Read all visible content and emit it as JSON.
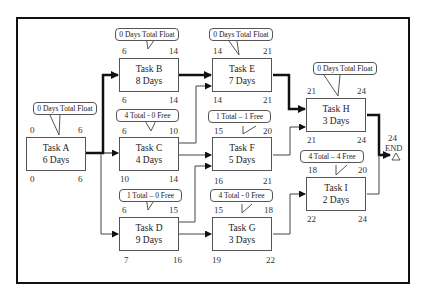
{
  "diagram": {
    "type": "activity-on-node network (critical path)",
    "tasks": [
      {
        "id": "A",
        "name": "Task A",
        "duration": "6 Days",
        "es": "0",
        "ef": "6",
        "ls": "0",
        "lf": "6",
        "float_label": "0 Days Total Float",
        "critical": true
      },
      {
        "id": "B",
        "name": "Task B",
        "duration": "8 Days",
        "es": "6",
        "ef": "14",
        "ls": "6",
        "lf": "14",
        "float_label": "0 Days Total Float",
        "critical": true
      },
      {
        "id": "C",
        "name": "Task C",
        "duration": "4 Days",
        "es": "6",
        "ef": "10",
        "ls": "10",
        "lf": "14",
        "float_label": "4 Total - 0 Free",
        "critical": false
      },
      {
        "id": "D",
        "name": "Task D",
        "duration": "9 Days",
        "es": "6",
        "ef": "15",
        "ls": "7",
        "lf": "16",
        "float_label": "1 Total – 0 Free",
        "critical": false
      },
      {
        "id": "E",
        "name": "Task E",
        "duration": "7 Days",
        "es": "14",
        "ef": "21",
        "ls": "14",
        "lf": "21",
        "float_label": "0 Days Total Float",
        "critical": true
      },
      {
        "id": "F",
        "name": "Task F",
        "duration": "5 Days",
        "es": "15",
        "ef": "20",
        "ls": "16",
        "lf": "21",
        "float_label": "1 Total – 1 Free",
        "critical": false
      },
      {
        "id": "G",
        "name": "Task G",
        "duration": "3 Days",
        "es": "15",
        "ef": "18",
        "ls": "19",
        "lf": "22",
        "float_label": "4 Total - 0 Free",
        "critical": false
      },
      {
        "id": "H",
        "name": "Task H",
        "duration": "3 Days",
        "es": "21",
        "ef": "24",
        "ls": "21",
        "lf": "24",
        "float_label": "0 Days Total Float",
        "critical": true
      },
      {
        "id": "I",
        "name": "Task I",
        "duration": "2 Days",
        "es": "18",
        "ef": "20",
        "ls": "22",
        "lf": "24",
        "float_label": "4 Total – 4 Free",
        "critical": false
      }
    ],
    "end": {
      "label": "END",
      "time": "24"
    },
    "edges": [
      [
        "A",
        "B"
      ],
      [
        "A",
        "C"
      ],
      [
        "A",
        "D"
      ],
      [
        "B",
        "E"
      ],
      [
        "C",
        "E"
      ],
      [
        "C",
        "F"
      ],
      [
        "D",
        "F"
      ],
      [
        "D",
        "G"
      ],
      [
        "E",
        "H"
      ],
      [
        "F",
        "H"
      ],
      [
        "G",
        "I"
      ],
      [
        "H",
        "END"
      ],
      [
        "I",
        "END"
      ]
    ]
  }
}
